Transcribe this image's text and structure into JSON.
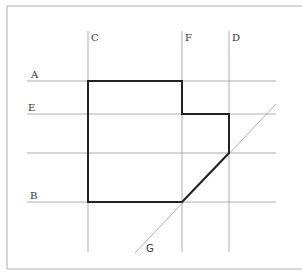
{
  "diagram": {
    "frame": {
      "x": 7,
      "y": 6,
      "bottom": 269,
      "color": "#aaaaaa"
    },
    "vertical_lines": [
      {
        "label": "C",
        "x": 88
      },
      {
        "label": "F",
        "x": 182
      },
      {
        "label": "D",
        "x": 229
      }
    ],
    "horizontal_lines": [
      {
        "label": "A",
        "y": 81
      },
      {
        "label": "E",
        "y": 114
      },
      {
        "label": "",
        "y": 153
      },
      {
        "label": "B",
        "y": 202
      }
    ],
    "diagonal_line": {
      "label": "G"
    },
    "shape_points": "88,81 182,81 182,114 229,114 229,153 182,202 88,202",
    "colors": {
      "grid": "#999999",
      "shape": "#222222"
    }
  }
}
